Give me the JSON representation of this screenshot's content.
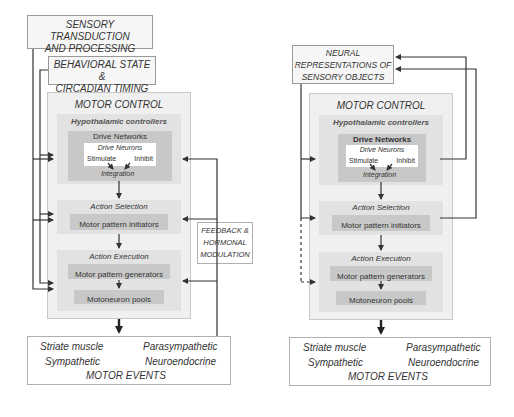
{
  "left": {
    "sensory": "SENSORY TRANSDUCTION AND PROCESSING",
    "sensory_l1": "SENSORY TRANSDUCTION",
    "sensory_l2": "AND PROCESSING",
    "behavioral_l1": "BEHAVIORAL STATE &",
    "behavioral_l2": "CIRCADIAN TIMING",
    "motor_control": "MOTOR CONTROL",
    "hypothalamic": "Hypothalamic controllers",
    "drive_networks": "Drive Networks",
    "drive_neurons": "Drive Neurons",
    "stimulate": "Stimulate",
    "inhibit": "Inhibit",
    "integration": "Integration",
    "action_selection": "Action Selection",
    "motor_pattern_initiators": "Motor pattern initiators",
    "action_execution": "Action Execution",
    "motor_pattern_generators": "Motor pattern generators",
    "motoneuron_pools": "Motoneuron pools",
    "feedback_l1": "FEEDBACK &",
    "feedback_l2": "HORMONAL",
    "feedback_l3": "MODULATION",
    "events": {
      "striate": "Striate muscle",
      "parasympathetic": "Parasympathetic",
      "sympathetic": "Sympathetic",
      "neuroendocrine": "Neuroendocrine",
      "title": "MOTOR EVENTS"
    }
  },
  "right": {
    "neural_l1": "NEURAL",
    "neural_l2": "REPRESENTATIONS OF",
    "neural_l3": "SENSORY OBJECTS",
    "motor_control": "MOTOR CONTROL",
    "hypothalamic": "Hypothalamic controllers",
    "drive_networks": "Drive Networks",
    "drive_neurons": "Drive Neurons",
    "stimulate": "Stimulate",
    "inhibit": "Inhibit",
    "integration": "Integration",
    "action_selection": "Action Selection",
    "motor_pattern_initiators": "Motor pattern initiators",
    "action_execution": "Action Execution",
    "motor_pattern_generators": "Motor pattern generators",
    "motoneuron_pools": "Motoneuron pools",
    "events": {
      "striate": "Striate muscle",
      "parasympathetic": "Parasympathetic",
      "sympathetic": "Sympathetic",
      "neuroendocrine": "Neuroendocrine",
      "title": "MOTOR EVENTS"
    }
  },
  "colors": {
    "line": "#333333",
    "box_border": "#9a9a9a",
    "panel": "#f0f0f0",
    "panel_mid": "#e2e2e2",
    "panel_dark": "#c8c8c8"
  }
}
